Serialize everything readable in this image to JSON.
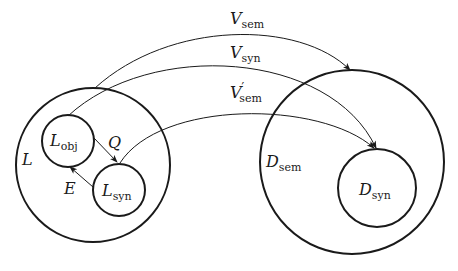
{
  "diagram": {
    "sets": {
      "L": {
        "label": "L",
        "sub": ""
      },
      "L_obj": {
        "label": "L",
        "sub": "obj"
      },
      "L_syn": {
        "label": "L",
        "sub": "syn"
      },
      "D_sem": {
        "label": "D",
        "sub": "sem"
      },
      "D_syn": {
        "label": "D",
        "sub": "syn"
      }
    },
    "arrows": {
      "Q": {
        "label": "Q",
        "from": "L_obj",
        "to": "L_syn"
      },
      "E": {
        "label": "E",
        "from": "L_syn",
        "to": "L_obj"
      },
      "V_sem": {
        "label": "V",
        "sub": "sem",
        "prime": "",
        "from": "L",
        "to": "D_sem"
      },
      "V_syn": {
        "label": "V",
        "sub": "syn",
        "prime": "",
        "from": "L_obj",
        "to": "D_syn"
      },
      "V_sem_prime": {
        "label": "V",
        "sub": "sem",
        "prime": "′",
        "from": "L_syn",
        "to": "D_syn"
      }
    },
    "colors": {
      "stroke": "#1a1a1a",
      "background": "#ffffff"
    }
  }
}
